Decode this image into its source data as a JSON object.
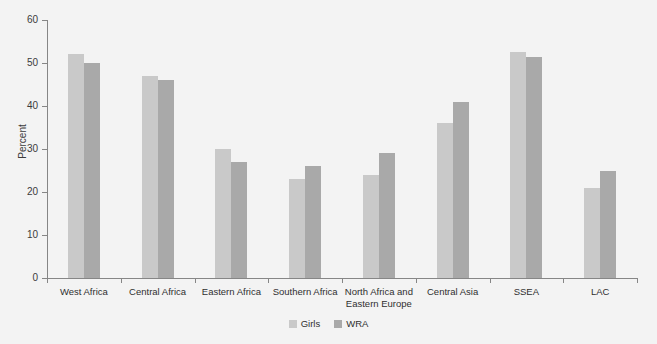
{
  "chart_data": {
    "type": "bar",
    "title": "",
    "subtitle": "",
    "xlabel": "",
    "ylabel": "Percent",
    "ylim": [
      0,
      60
    ],
    "yticks": [
      0,
      10,
      20,
      30,
      40,
      50,
      60
    ],
    "ytick_labels": [
      "0",
      "10",
      "20",
      "30",
      "40",
      "50",
      "60"
    ],
    "grid": false,
    "legend_position": "bottom-center",
    "categories": [
      "West Africa",
      "Central Africa",
      "Eastern Africa",
      "Southern Africa",
      "North Africa and\nEastern Europe",
      "Central Asia",
      "SSEA",
      "LAC"
    ],
    "series": [
      {
        "name": "Girls",
        "color": "#c9c9c9",
        "values": [
          52,
          47,
          30,
          23,
          24,
          36,
          52.5,
          21
        ]
      },
      {
        "name": "WRA",
        "color": "#a9a9a9",
        "values": [
          50,
          46,
          27,
          26,
          29,
          41,
          51.5,
          25
        ]
      }
    ],
    "annotations": []
  },
  "figure": {
    "background_color": "#f3f3f3",
    "axis_color": "#868686"
  }
}
